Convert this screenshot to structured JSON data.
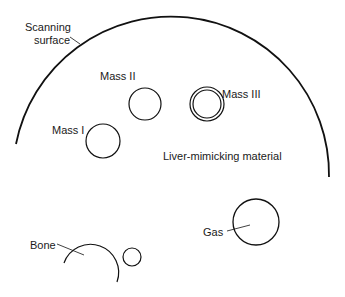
{
  "diagram": {
    "labels": {
      "scanning_surface_line1": "Scanning",
      "scanning_surface_line2": "surface",
      "mass_1": "Mass I",
      "mass_2": "Mass II",
      "mass_3": "Mass III",
      "liver": "Liver-mimicking material",
      "gas": "Gas",
      "bone": "Bone"
    },
    "colors": {
      "line": "#111111",
      "text": "#1a1a1a",
      "background": "#ffffff"
    }
  }
}
